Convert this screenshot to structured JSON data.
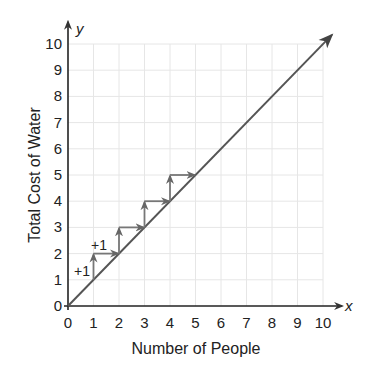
{
  "chart_data": {
    "type": "line",
    "title": "",
    "xlabel": "Number of People",
    "ylabel": "Total Cost of Water",
    "x_axis_variable": "x",
    "y_axis_variable": "y",
    "xlim": [
      0,
      10
    ],
    "ylim": [
      0,
      10
    ],
    "x_ticks": [
      "0",
      "1",
      "2",
      "3",
      "4",
      "5",
      "6",
      "7",
      "8",
      "9",
      "10"
    ],
    "y_ticks": [
      "0",
      "1",
      "2",
      "3",
      "4",
      "5",
      "6",
      "7",
      "8",
      "9",
      "10"
    ],
    "grid": true,
    "series": [
      {
        "name": "cost line",
        "x": [
          0,
          10
        ],
        "y": [
          0,
          10
        ],
        "arrow_end": true,
        "color": "#555555"
      }
    ],
    "step_arrows": [
      {
        "from": [
          1,
          1
        ],
        "to": [
          1,
          2
        ],
        "direction": "up"
      },
      {
        "from": [
          1,
          2
        ],
        "to": [
          2,
          2
        ],
        "direction": "right"
      },
      {
        "from": [
          2,
          2
        ],
        "to": [
          2,
          3
        ],
        "direction": "up"
      },
      {
        "from": [
          2,
          3
        ],
        "to": [
          3,
          3
        ],
        "direction": "right"
      },
      {
        "from": [
          3,
          3
        ],
        "to": [
          3,
          4
        ],
        "direction": "up"
      },
      {
        "from": [
          3,
          4
        ],
        "to": [
          4,
          4
        ],
        "direction": "right"
      },
      {
        "from": [
          4,
          4
        ],
        "to": [
          4,
          5
        ],
        "direction": "up"
      },
      {
        "from": [
          4,
          5
        ],
        "to": [
          5,
          5
        ],
        "direction": "right"
      }
    ],
    "annotations": [
      {
        "text": "+1",
        "near": [
          0.6,
          1.4
        ],
        "meaning": "vertical change"
      },
      {
        "text": "+1",
        "near": [
          1.3,
          2.3
        ],
        "meaning": "horizontal change"
      }
    ],
    "legend": null
  },
  "labels": {
    "xlabel": "Number of People",
    "ylabel": "Total Cost of Water",
    "xvar": "x",
    "yvar": "y",
    "annot1": "+1",
    "annot2": "+1"
  }
}
